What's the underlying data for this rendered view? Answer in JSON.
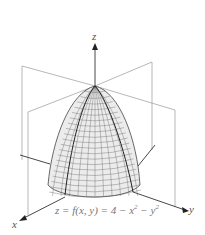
{
  "figure": {
    "axes": {
      "x_label": "x",
      "y_label": "y",
      "z_label": "z"
    },
    "equation": {
      "lhs": "z = f(x, y) = 4 − x",
      "exp1": "2",
      "mid": " − y",
      "exp2": "2"
    },
    "surface": {
      "type": "paraboloid",
      "formula": "4 - x^2 - y^2",
      "opens": "down"
    },
    "colors": {
      "plane": "#9a9a9a",
      "axis": "#333333",
      "mesh": "#555555",
      "fill": "#e6e6e6"
    }
  }
}
